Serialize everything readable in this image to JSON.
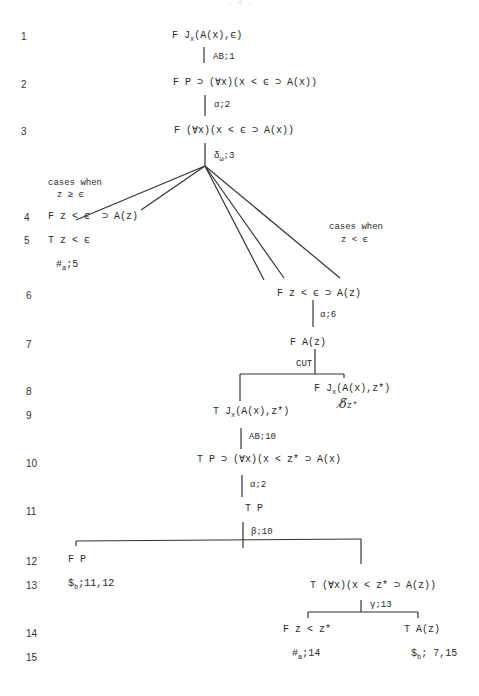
{
  "page_number": "- 4 -",
  "line_numbers": [
    "1",
    "2",
    "3",
    "4",
    "5",
    "6",
    "7",
    "8",
    "9",
    "10",
    "11",
    "12",
    "13",
    "14",
    "15"
  ],
  "nodes": {
    "n1": {
      "prefix": "F J",
      "sub": "x",
      "suffix": "(A(x),ϵ)"
    },
    "r1": "AB;1",
    "n2": "F P ⊃ (∀x)(x < ϵ ⊃ A(x))",
    "r2": "α;2",
    "n3": "F (∀x)(x < ϵ ⊃ A(x))",
    "r3": {
      "prefix": "δ",
      "sub": "ω",
      "suffix": ";3"
    },
    "cases_ge": {
      "line1": "cases when",
      "line2": "z ≥ ϵ"
    },
    "cases_lt": {
      "line1": "cases when",
      "line2": "z < ϵ"
    },
    "n4": "F z < ϵ  ⊃ A(z)",
    "n5": "T z < ϵ",
    "close5": {
      "prefix": "#",
      "sub": "a",
      "suffix": ";5"
    },
    "n6": "F z < ϵ ⊃ A(z)",
    "r6": "α;6",
    "n7": "F A(z)",
    "r7": "CUT",
    "n8": {
      "prefix": "F J",
      "sub": "x",
      "suffix": "(A(x),z*)"
    },
    "hand8": {
      "mark": "δ̸",
      "var": "z*"
    },
    "n9": {
      "prefix": "T J",
      "sub": "x",
      "suffix": "(A(x),z*)"
    },
    "r9": "AB;10",
    "n10": "T P ⊃ (∀x)(x < z* ⊃ A(x)",
    "r10": "α;2",
    "n11": "T P",
    "r11": "β;10",
    "n12": "F P",
    "close13": {
      "prefix": "$",
      "sub": "b",
      "suffix": ";11,12"
    },
    "n13": "T (∀x)(x < z* ⊃ A(z))",
    "r13": "γ;13",
    "n14a": "F z < z*",
    "n14b": "T A(z)",
    "close15a": {
      "prefix": "#",
      "sub": "a",
      "suffix": ";14"
    },
    "close15b": {
      "prefix": "$",
      "sub": "b",
      "suffix": "; 7,15"
    }
  }
}
